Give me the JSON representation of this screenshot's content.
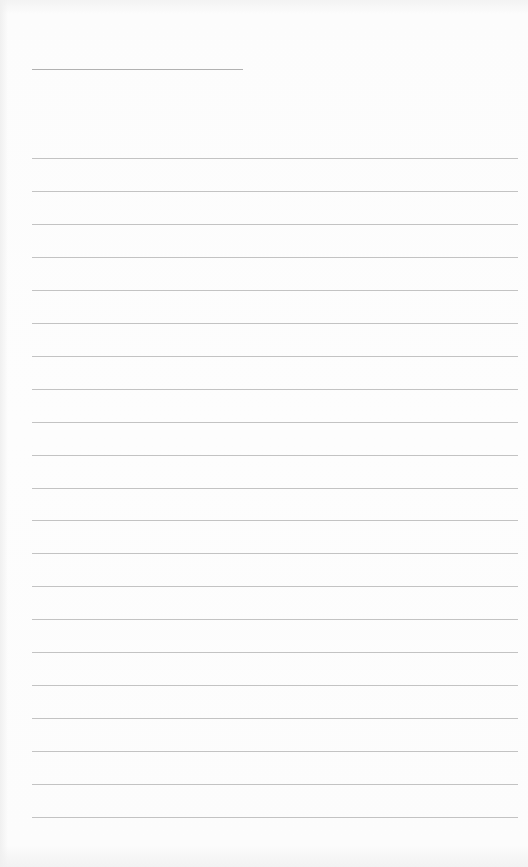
{
  "document": {
    "type": "blank-lined-paper",
    "background_color": "#fbfbfb",
    "line_color": "#b9b9b9",
    "header_rule": {
      "x": 32,
      "y": 69,
      "width": 211
    },
    "ruled_lines": {
      "count": 21,
      "x": 32,
      "width": 486,
      "first_y": 158,
      "spacing": 32.95
    }
  }
}
